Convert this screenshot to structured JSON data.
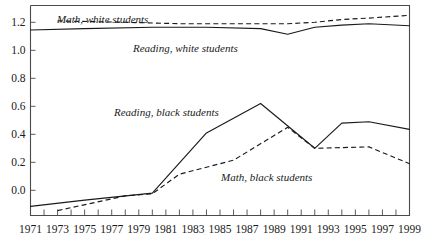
{
  "chart_data": {
    "type": "line",
    "title": "",
    "subtitle": "",
    "xlabel": "",
    "ylabel": "",
    "xlim": [
      1971,
      1999
    ],
    "ylim": [
      -0.18,
      1.32
    ],
    "grid": false,
    "legend_position": "inline-annotations",
    "yticks": [
      "0.0",
      "0.2",
      "0.4",
      "0.6",
      "0.8",
      "1.0",
      "1.2"
    ],
    "ytick_values": [
      0.0,
      0.2,
      0.4,
      0.6,
      0.8,
      1.0,
      1.2
    ],
    "xticks": [
      "1971",
      "1973",
      "1975",
      "1977",
      "1979",
      "1981",
      "1983",
      "1985",
      "1987",
      "1989",
      "1991",
      "1993",
      "1995",
      "1997",
      "1999"
    ],
    "xtick_values": [
      1971,
      1973,
      1975,
      1977,
      1979,
      1981,
      1983,
      1985,
      1987,
      1989,
      1991,
      1993,
      1995,
      1997,
      1999
    ],
    "xtick_minor_values": [
      1972,
      1974,
      1976,
      1978,
      1980,
      1982,
      1984,
      1986,
      1988,
      1990,
      1992,
      1994,
      1996,
      1998
    ],
    "series": [
      {
        "name": "Math, white students",
        "style": "dashed",
        "color": "#1a1a1a",
        "label_text": "Math, white students",
        "x": [
          1973,
          1978,
          1982,
          1986,
          1990,
          1992,
          1994,
          1996,
          1999
        ],
        "values": [
          1.21,
          1.2,
          1.19,
          1.19,
          1.19,
          1.2,
          1.22,
          1.23,
          1.25
        ]
      },
      {
        "name": "Reading, white students",
        "style": "solid",
        "color": "#1a1a1a",
        "label_text": "Reading, white students",
        "x": [
          1971,
          1975,
          1980,
          1984,
          1988,
          1990,
          1992,
          1994,
          1996,
          1999
        ],
        "values": [
          1.145,
          1.155,
          1.165,
          1.165,
          1.155,
          1.115,
          1.165,
          1.18,
          1.19,
          1.175
        ]
      },
      {
        "name": "Reading, black students",
        "style": "solid",
        "color": "#1a1a1a",
        "label_text": "Reading, black students",
        "x": [
          1971,
          1975,
          1980,
          1984,
          1988,
          1992,
          1994,
          1996,
          1999
        ],
        "values": [
          -0.115,
          -0.07,
          -0.02,
          0.41,
          0.62,
          0.3,
          0.48,
          0.49,
          0.435
        ]
      },
      {
        "name": "Math, black students",
        "style": "dashed",
        "color": "#1a1a1a",
        "label_text": "Math, black students",
        "x": [
          1973,
          1978,
          1980,
          1982,
          1986,
          1990,
          1992,
          1996,
          1999
        ],
        "values": [
          -0.145,
          -0.04,
          -0.025,
          0.115,
          0.215,
          0.45,
          0.3,
          0.31,
          0.19
        ]
      }
    ],
    "annotations": [
      {
        "text": "Math, white students",
        "x_px": 57,
        "y_px": 23,
        "anchor": "start"
      },
      {
        "text": "Reading, white students",
        "x_px": 133,
        "y_px": 52,
        "anchor": "start"
      },
      {
        "text": "Reading, black students",
        "x_px": 114,
        "y_px": 116,
        "anchor": "start"
      },
      {
        "text": "Math, black students",
        "x_px": 221,
        "y_px": 181,
        "anchor": "start"
      }
    ]
  }
}
